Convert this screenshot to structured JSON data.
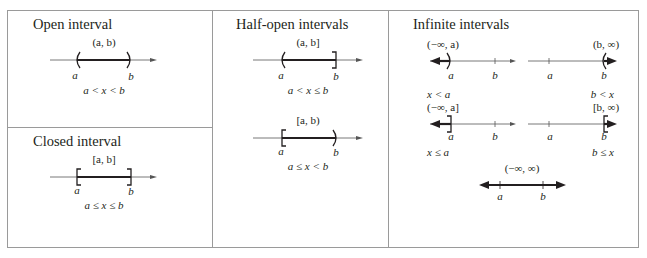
{
  "panels": {
    "open": {
      "title": "Open interval",
      "lines": [
        {
          "notation": "(a, b)",
          "inequality": "a < x < b",
          "a_label": "a",
          "b_label": "b",
          "left_end": "open-paren",
          "right_end": "open-paren",
          "shaded": "between"
        }
      ]
    },
    "closed": {
      "title": "Closed interval",
      "lines": [
        {
          "notation": "[a, b]",
          "inequality": "a ≤ x ≤ b",
          "a_label": "a",
          "b_label": "b",
          "left_end": "closed-bracket",
          "right_end": "closed-bracket",
          "shaded": "between"
        }
      ]
    },
    "half_open": {
      "title": "Half-open intervals",
      "lines": [
        {
          "notation": "(a, b]",
          "inequality": "a < x ≤ b",
          "a_label": "a",
          "b_label": "b",
          "left_end": "open-paren",
          "right_end": "closed-bracket",
          "shaded": "between"
        },
        {
          "notation": "[a, b)",
          "inequality": "a ≤ x < b",
          "a_label": "a",
          "b_label": "b",
          "left_end": "closed-bracket",
          "right_end": "open-paren",
          "shaded": "between"
        }
      ]
    },
    "infinite": {
      "title": "Infinite intervals",
      "lines": [
        {
          "notation": "(−∞, a)",
          "inequality": "x < a",
          "a_label": "a",
          "b_label": "b",
          "shaded": "left-of-a",
          "end": "open-paren"
        },
        {
          "notation": "(b, ∞)",
          "inequality": "b < x",
          "a_label": "a",
          "b_label": "b",
          "shaded": "right-of-b",
          "end": "open-paren"
        },
        {
          "notation": "(−∞, a]",
          "inequality": "x ≤ a",
          "a_label": "a",
          "b_label": "b",
          "shaded": "left-of-a",
          "end": "closed-bracket"
        },
        {
          "notation": "[b, ∞)",
          "inequality": "b ≤ x",
          "a_label": "a",
          "b_label": "b",
          "shaded": "right-of-b",
          "end": "closed-bracket"
        },
        {
          "notation": "(−∞, ∞)",
          "inequality": "",
          "a_label": "a",
          "b_label": "b",
          "shaded": "all",
          "end": "none"
        }
      ]
    }
  },
  "colors": {
    "border": "#9a9a9a",
    "axis": "#555555",
    "shade": "#231f20",
    "text": "#231f20"
  }
}
